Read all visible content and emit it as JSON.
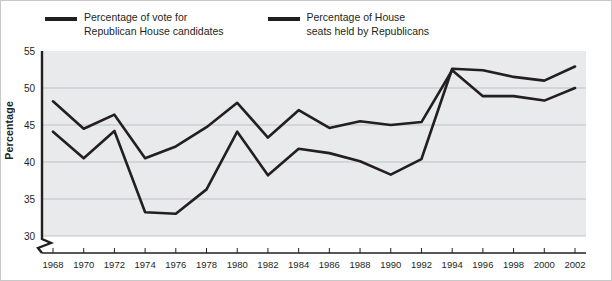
{
  "legend": {
    "position": "top-left",
    "entries": [
      {
        "name": "vote-series",
        "label": "Percentage of vote for\nRepublican House candidates",
        "color": "#231f20"
      },
      {
        "name": "seats-series",
        "label": "Percentage of House\nseats held by Republicans",
        "color": "#231f20"
      }
    ]
  },
  "axes": {
    "ylabel": "Percentage",
    "xlabel": "",
    "y_ticks": [
      30,
      35,
      40,
      45,
      50,
      55
    ],
    "axis_break": true
  },
  "colors": {
    "plot_background": "#e9eaec",
    "gridline": "#b9bcc0",
    "axis": "#231f20",
    "series": "#231f20",
    "frame": "#c8c8c8",
    "text": "#231f20"
  },
  "chart_data": {
    "type": "line",
    "title": "",
    "subtitle": "",
    "xlabel": "",
    "ylabel": "Percentage",
    "grid": true,
    "legend_position": "top-left",
    "xlim": [
      1968,
      2002
    ],
    "ylim": [
      28,
      55
    ],
    "yticks": [
      30,
      35,
      40,
      45,
      50,
      55
    ],
    "x": [
      1968,
      1970,
      1972,
      1974,
      1976,
      1978,
      1980,
      1982,
      1984,
      1986,
      1988,
      1990,
      1992,
      1994,
      1996,
      1998,
      2000,
      2002
    ],
    "xticklabels": [
      "1968",
      "1970",
      "1972",
      "1974",
      "1976",
      "1978",
      "1980",
      "1982",
      "1984",
      "1986",
      "1988",
      "1990",
      "1992",
      "1994",
      "1996",
      "1998",
      "2000",
      "2002"
    ],
    "series": [
      {
        "name": "Percentage of vote for Republican House candidates",
        "color": "#231f20",
        "values": [
          48.2,
          44.5,
          46.4,
          40.5,
          42.1,
          44.7,
          48.0,
          43.3,
          47.0,
          44.6,
          45.5,
          45.0,
          45.4,
          52.4,
          48.9,
          48.9,
          48.3,
          50.0
        ]
      },
      {
        "name": "Percentage of House seats held by Republicans",
        "color": "#231f20",
        "values": [
          44.1,
          40.5,
          44.2,
          33.2,
          33.0,
          36.3,
          44.1,
          38.2,
          41.8,
          41.2,
          40.1,
          38.3,
          40.4,
          52.6,
          52.4,
          51.5,
          51.0,
          52.9
        ]
      }
    ],
    "annotations": []
  }
}
